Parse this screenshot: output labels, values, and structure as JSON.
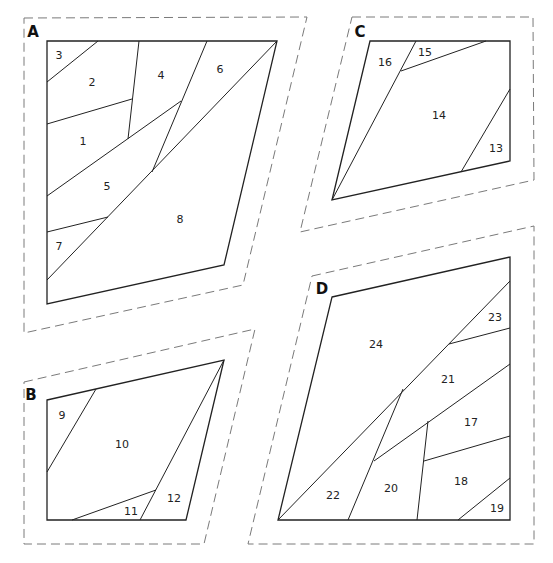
{
  "colors": {
    "outline": "#222222",
    "seam_allowance": "#7a7a7a",
    "background": "#ffffff"
  },
  "sections": [
    {
      "id": "A",
      "label": "A",
      "label_pos": [
        33,
        32
      ],
      "dashed": [
        [
          24,
          18
        ],
        [
          307,
          17
        ],
        [
          243,
          285
        ],
        [
          24,
          333
        ]
      ],
      "outline": [
        [
          47,
          41
        ],
        [
          277,
          41
        ],
        [
          224,
          265
        ],
        [
          47,
          304
        ]
      ],
      "seams": [
        [
          [
            47,
            82
          ],
          [
            98,
            41
          ]
        ],
        [
          [
            47,
            124
          ],
          [
            132,
            99
          ]
        ],
        [
          [
            139,
            41
          ],
          [
            128,
            139
          ]
        ],
        [
          [
            47,
            196
          ],
          [
            181,
            101
          ]
        ],
        [
          [
            207,
            41
          ],
          [
            152,
            172
          ]
        ],
        [
          [
            277,
            41
          ],
          [
            47,
            280
          ]
        ],
        [
          [
            47,
            232
          ],
          [
            108,
            217
          ]
        ]
      ],
      "pieces": [
        {
          "n": "1",
          "pos": [
            83,
            141
          ]
        },
        {
          "n": "2",
          "pos": [
            92,
            82
          ]
        },
        {
          "n": "3",
          "pos": [
            59,
            55
          ]
        },
        {
          "n": "4",
          "pos": [
            161,
            75
          ]
        },
        {
          "n": "5",
          "pos": [
            107,
            186
          ]
        },
        {
          "n": "6",
          "pos": [
            220,
            69
          ]
        },
        {
          "n": "7",
          "pos": [
            59,
            246
          ]
        },
        {
          "n": "8",
          "pos": [
            180,
            219
          ]
        }
      ]
    },
    {
      "id": "B",
      "label": "B",
      "label_pos": [
        31,
        395
      ],
      "dashed": [
        [
          24,
          382
        ],
        [
          255,
          329
        ],
        [
          204,
          544
        ],
        [
          24,
          544
        ]
      ],
      "outline": [
        [
          47,
          400
        ],
        [
          224,
          360
        ],
        [
          186,
          520
        ],
        [
          47,
          520
        ]
      ],
      "seams": [
        [
          [
            47,
            472
          ],
          [
            96,
            389
          ]
        ],
        [
          [
            224,
            360
          ],
          [
            140,
            520
          ]
        ],
        [
          [
            72,
            520
          ],
          [
            156,
            490
          ]
        ]
      ],
      "pieces": [
        {
          "n": "9",
          "pos": [
            62,
            415
          ]
        },
        {
          "n": "10",
          "pos": [
            122,
            444
          ]
        },
        {
          "n": "11",
          "pos": [
            131,
            511
          ]
        },
        {
          "n": "12",
          "pos": [
            174,
            498
          ]
        }
      ]
    },
    {
      "id": "C",
      "label": "C",
      "label_pos": [
        360,
        32
      ],
      "dashed": [
        [
          352,
          17
        ],
        [
          533,
          17
        ],
        [
          534,
          180
        ],
        [
          300,
          232
        ]
      ],
      "outline": [
        [
          370,
          41
        ],
        [
          510,
          41
        ],
        [
          510,
          161
        ],
        [
          332,
          200
        ]
      ],
      "seams": [
        [
          [
            416,
            41
          ],
          [
            332,
            200
          ]
        ],
        [
          [
            401,
            71
          ],
          [
            486,
            41
          ]
        ],
        [
          [
            510,
            89
          ],
          [
            461,
            172
          ]
        ]
      ],
      "pieces": [
        {
          "n": "13",
          "pos": [
            496,
            148
          ]
        },
        {
          "n": "14",
          "pos": [
            439,
            115
          ]
        },
        {
          "n": "15",
          "pos": [
            425,
            52
          ]
        },
        {
          "n": "16",
          "pos": [
            385,
            62
          ]
        }
      ]
    },
    {
      "id": "D",
      "label": "D",
      "label_pos": [
        322,
        289
      ],
      "dashed": [
        [
          312,
          276
        ],
        [
          534,
          226
        ],
        [
          534,
          544
        ],
        [
          248,
          544
        ]
      ],
      "outline": [
        [
          332,
          297
        ],
        [
          510,
          257
        ],
        [
          510,
          520
        ],
        [
          278,
          520
        ]
      ],
      "seams": [
        [
          [
            278,
            520
          ],
          [
            510,
            281
          ]
        ],
        [
          [
            449,
            344
          ],
          [
            510,
            328
          ]
        ],
        [
          [
            403,
            389
          ],
          [
            348,
            520
          ]
        ],
        [
          [
            374,
            461
          ],
          [
            510,
            364
          ]
        ],
        [
          [
            428,
            421
          ],
          [
            417,
            520
          ]
        ],
        [
          [
            424,
            461
          ],
          [
            510,
            436
          ]
        ],
        [
          [
            458,
            520
          ],
          [
            510,
            478
          ]
        ]
      ],
      "pieces": [
        {
          "n": "17",
          "pos": [
            471,
            422
          ]
        },
        {
          "n": "18",
          "pos": [
            461,
            481
          ]
        },
        {
          "n": "19",
          "pos": [
            497,
            508
          ]
        },
        {
          "n": "20",
          "pos": [
            391,
            488
          ]
        },
        {
          "n": "21",
          "pos": [
            448,
            379
          ]
        },
        {
          "n": "22",
          "pos": [
            333,
            495
          ]
        },
        {
          "n": "23",
          "pos": [
            495,
            317
          ]
        },
        {
          "n": "24",
          "pos": [
            376,
            344
          ]
        }
      ]
    }
  ]
}
